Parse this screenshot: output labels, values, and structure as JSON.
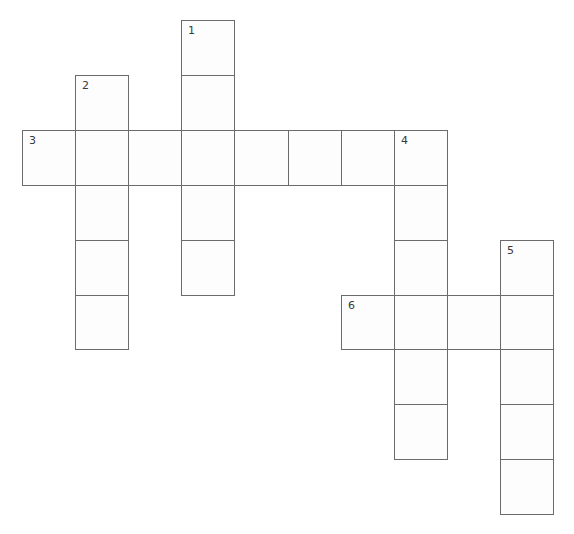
{
  "puzzle": {
    "type": "crossword",
    "grid": {
      "origin_x": 22,
      "origin_y": 20,
      "cell_width": 53.1,
      "cell_height": 54.9,
      "cols": 10,
      "rows": 9
    },
    "colors": {
      "border": "#6b6b6b",
      "cell_fill": "#fdfdfd",
      "number": "#3a3a3a",
      "background": "#ffffff"
    },
    "entries": [
      {
        "number": "1",
        "direction": "down",
        "row": 0,
        "col": 3,
        "length": 5
      },
      {
        "number": "2",
        "direction": "down",
        "row": 1,
        "col": 1,
        "length": 5
      },
      {
        "number": "3",
        "direction": "across",
        "row": 2,
        "col": 0,
        "length": 8
      },
      {
        "number": "4",
        "direction": "down",
        "row": 2,
        "col": 7,
        "length": 6
      },
      {
        "number": "5",
        "direction": "down",
        "row": 4,
        "col": 9,
        "length": 5
      },
      {
        "number": "6",
        "direction": "across",
        "row": 5,
        "col": 6,
        "length": 4
      }
    ],
    "cells": [
      {
        "row": 0,
        "col": 3,
        "number": "1",
        "value": ""
      },
      {
        "row": 1,
        "col": 1,
        "number": "2",
        "value": ""
      },
      {
        "row": 1,
        "col": 3,
        "number": "",
        "value": ""
      },
      {
        "row": 2,
        "col": 0,
        "number": "3",
        "value": ""
      },
      {
        "row": 2,
        "col": 1,
        "number": "",
        "value": ""
      },
      {
        "row": 2,
        "col": 2,
        "number": "",
        "value": ""
      },
      {
        "row": 2,
        "col": 3,
        "number": "",
        "value": ""
      },
      {
        "row": 2,
        "col": 4,
        "number": "",
        "value": ""
      },
      {
        "row": 2,
        "col": 5,
        "number": "",
        "value": ""
      },
      {
        "row": 2,
        "col": 6,
        "number": "",
        "value": ""
      },
      {
        "row": 2,
        "col": 7,
        "number": "4",
        "value": ""
      },
      {
        "row": 3,
        "col": 1,
        "number": "",
        "value": ""
      },
      {
        "row": 3,
        "col": 3,
        "number": "",
        "value": ""
      },
      {
        "row": 3,
        "col": 7,
        "number": "",
        "value": ""
      },
      {
        "row": 4,
        "col": 1,
        "number": "",
        "value": ""
      },
      {
        "row": 4,
        "col": 3,
        "number": "",
        "value": ""
      },
      {
        "row": 4,
        "col": 7,
        "number": "",
        "value": ""
      },
      {
        "row": 4,
        "col": 9,
        "number": "5",
        "value": ""
      },
      {
        "row": 5,
        "col": 1,
        "number": "",
        "value": ""
      },
      {
        "row": 5,
        "col": 6,
        "number": "6",
        "value": ""
      },
      {
        "row": 5,
        "col": 7,
        "number": "",
        "value": ""
      },
      {
        "row": 5,
        "col": 8,
        "number": "",
        "value": ""
      },
      {
        "row": 5,
        "col": 9,
        "number": "",
        "value": ""
      },
      {
        "row": 6,
        "col": 7,
        "number": "",
        "value": ""
      },
      {
        "row": 6,
        "col": 9,
        "number": "",
        "value": ""
      },
      {
        "row": 7,
        "col": 7,
        "number": "",
        "value": ""
      },
      {
        "row": 7,
        "col": 9,
        "number": "",
        "value": ""
      },
      {
        "row": 8,
        "col": 9,
        "number": "",
        "value": ""
      }
    ]
  }
}
